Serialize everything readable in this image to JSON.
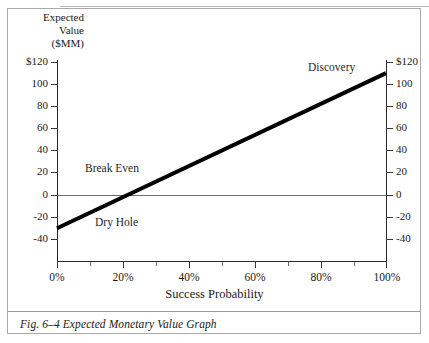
{
  "figure": {
    "caption": "Fig. 6–4 Expected Monetary Value Graph"
  },
  "chart_data": {
    "type": "line",
    "title": "",
    "xlabel": "Success Probability",
    "ylabel": "Expected Value ($MM)",
    "ylabel_lines": [
      "Expected",
      "Value",
      "($MM)"
    ],
    "xlim": [
      0,
      100
    ],
    "ylim": [
      -50,
      120
    ],
    "grid": false,
    "legend": "none",
    "x_tick_labels": [
      "0%",
      "20%",
      "40%",
      "60%",
      "80%",
      "100%"
    ],
    "x_tick_values": [
      0,
      20,
      40,
      60,
      80,
      100
    ],
    "x_minor_tick_values": [
      10,
      30,
      50,
      70,
      90
    ],
    "y_tick_labels_left": [
      "$120",
      "100",
      "80",
      "60",
      "40",
      "20",
      "0",
      "-20",
      "-40"
    ],
    "y_tick_labels_right": [
      "$120",
      "100",
      "80",
      "60",
      "40",
      "20",
      "0",
      "-20",
      "-40"
    ],
    "y_tick_values": [
      120,
      100,
      80,
      60,
      40,
      20,
      0,
      -20,
      -40
    ],
    "zero_reference_line": 0,
    "series": [
      {
        "name": "Expected Monetary Value",
        "x": [
          0,
          100
        ],
        "values": [
          -30,
          110
        ],
        "color": "#000000",
        "line_width": 4,
        "breakeven_x": 21.4
      }
    ],
    "annotations": [
      {
        "text": "Discovery",
        "x": 72,
        "y": 112
      },
      {
        "text": "Break Even",
        "x": 14,
        "y": 26
      },
      {
        "text": "Dry Hole",
        "x": 19,
        "y": -18
      }
    ]
  },
  "axis": {
    "y_ticks": [
      {
        "label_left": "$120",
        "label_right": "$120",
        "top": 62
      },
      {
        "label_left": "100",
        "label_right": "100",
        "top": 84
      },
      {
        "label_left": "80",
        "label_right": "80",
        "top": 106
      },
      {
        "label_left": "60",
        "label_right": "60",
        "top": 128
      },
      {
        "label_left": "40",
        "label_right": "40",
        "top": 150
      },
      {
        "label_left": "20",
        "label_right": "20",
        "top": 172
      },
      {
        "label_left": "0",
        "label_right": "0",
        "top": 195
      },
      {
        "label_left": "-20",
        "label_right": "-20",
        "top": 217
      },
      {
        "label_left": "-40",
        "label_right": "-40",
        "top": 239
      }
    ],
    "x_ticks": [
      {
        "label": "0%",
        "left": 57
      },
      {
        "label": "20%",
        "left": 123
      },
      {
        "label": "40%",
        "left": 189
      },
      {
        "label": "60%",
        "left": 255
      },
      {
        "label": "80%",
        "left": 321
      },
      {
        "label": "100%",
        "left": 386
      }
    ],
    "x_minor_ticks": [
      90,
      156,
      222,
      288,
      354
    ]
  }
}
